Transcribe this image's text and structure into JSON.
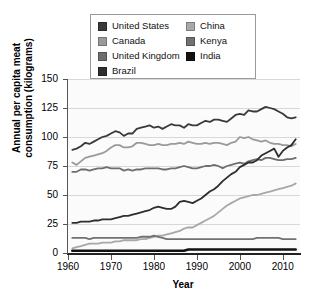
{
  "chart_data": {
    "type": "line",
    "title": "",
    "xlabel": "Year",
    "ylabel": "Annual per capita meat\nconsumption (kilograms)",
    "xlim": [
      1960,
      2014
    ],
    "ylim": [
      0,
      150
    ],
    "yticks": [
      0,
      25,
      50,
      75,
      100,
      125,
      150
    ],
    "xticks": [
      1960,
      1970,
      1980,
      1990,
      2000,
      2010
    ],
    "grid": true,
    "legend_position": "top-center-inside",
    "x": [
      1961,
      1962,
      1963,
      1964,
      1965,
      1966,
      1967,
      1968,
      1969,
      1970,
      1971,
      1972,
      1973,
      1974,
      1975,
      1976,
      1977,
      1978,
      1979,
      1980,
      1981,
      1982,
      1983,
      1984,
      1985,
      1986,
      1987,
      1988,
      1989,
      1990,
      1991,
      1992,
      1993,
      1994,
      1995,
      1996,
      1997,
      1998,
      1999,
      2000,
      2001,
      2002,
      2003,
      2004,
      2005,
      2006,
      2007,
      2008,
      2009,
      2010,
      2011,
      2012,
      2013
    ],
    "series": [
      {
        "name": "United States",
        "color": "#3a3a3a",
        "width": 1.8,
        "values": [
          89,
          90,
          92,
          95,
          94,
          96,
          98,
          100,
          101,
          103,
          105,
          104,
          101,
          103,
          103,
          107,
          108,
          109,
          110,
          108,
          109,
          107,
          109,
          111,
          110,
          110,
          108,
          111,
          110,
          110,
          112,
          114,
          113,
          115,
          115,
          114,
          113,
          116,
          119,
          120,
          119,
          123,
          122,
          122,
          124,
          126,
          125,
          124,
          122,
          120,
          117,
          116,
          117
        ]
      },
      {
        "name": "Canada",
        "color": "#9a9a9a",
        "width": 1.8,
        "values": [
          78,
          76,
          79,
          82,
          83,
          84,
          85,
          86,
          88,
          91,
          93,
          93,
          91,
          91,
          92,
          95,
          95,
          94,
          93,
          93,
          94,
          93,
          93,
          94,
          94,
          95,
          94,
          96,
          95,
          94,
          94,
          95,
          94,
          95,
          95,
          94,
          93,
          95,
          96,
          100,
          99,
          100,
          98,
          97,
          96,
          97,
          95,
          94,
          94,
          93,
          93,
          92,
          94
        ]
      },
      {
        "name": "United Kingdom",
        "color": "#6e6e6e",
        "width": 1.8,
        "values": [
          70,
          70,
          72,
          72,
          71,
          72,
          73,
          73,
          74,
          73,
          73,
          73,
          71,
          72,
          71,
          72,
          72,
          73,
          73,
          73,
          73,
          72,
          72,
          73,
          73,
          74,
          75,
          74,
          73,
          73,
          74,
          75,
          75,
          76,
          75,
          73,
          75,
          76,
          77,
          78,
          77,
          79,
          80,
          81,
          80,
          82,
          82,
          81,
          80,
          80,
          81,
          81,
          82
        ]
      },
      {
        "name": "Brazil",
        "color": "#2e2e2e",
        "width": 1.8,
        "values": [
          26,
          26,
          27,
          27,
          27,
          28,
          28,
          29,
          29,
          29,
          30,
          31,
          32,
          32,
          33,
          34,
          35,
          36,
          37,
          39,
          40,
          39,
          38,
          38,
          40,
          44,
          45,
          44,
          43,
          45,
          47,
          50,
          53,
          55,
          58,
          62,
          65,
          68,
          70,
          74,
          76,
          78,
          78,
          80,
          84,
          86,
          88,
          90,
          83,
          88,
          91,
          93,
          98
        ]
      },
      {
        "name": "China",
        "color": "#a8a8a8",
        "width": 1.8,
        "values": [
          4,
          5,
          6,
          7,
          8,
          8,
          8,
          9,
          9,
          9,
          10,
          10,
          11,
          11,
          11,
          11,
          12,
          12,
          13,
          14,
          15,
          15,
          16,
          17,
          18,
          19,
          21,
          22,
          22,
          24,
          26,
          28,
          30,
          32,
          35,
          38,
          41,
          43,
          45,
          47,
          48,
          49,
          50,
          50,
          51,
          52,
          53,
          54,
          55,
          56,
          57,
          58,
          60
        ]
      },
      {
        "name": "Kenya",
        "color": "#717171",
        "width": 1.8,
        "values": [
          13,
          13,
          13,
          13,
          12,
          13,
          13,
          13,
          13,
          13,
          13,
          13,
          13,
          13,
          13,
          13,
          14,
          14,
          14,
          15,
          14,
          13,
          12,
          12,
          12,
          12,
          12,
          12,
          12,
          12,
          12,
          12,
          12,
          12,
          12,
          12,
          12,
          12,
          12,
          12,
          12,
          12,
          12,
          13,
          13,
          13,
          13,
          13,
          13,
          12,
          12,
          12,
          12
        ]
      },
      {
        "name": "India",
        "color": "#111111",
        "width": 2.6,
        "values": [
          2,
          2,
          2,
          2,
          2,
          2,
          2,
          2,
          2,
          2,
          2,
          2,
          2,
          2,
          2,
          2,
          2,
          2,
          2,
          2,
          2,
          2,
          2,
          2,
          2,
          2,
          2,
          3,
          3,
          3,
          3,
          3,
          3,
          3,
          3,
          3,
          3,
          3,
          3,
          3,
          3,
          3,
          3,
          3,
          3,
          3,
          3,
          3,
          3,
          3,
          3,
          3,
          3
        ]
      }
    ]
  },
  "legend": {
    "left_column": [
      {
        "label": "United States",
        "color": "#3a3a3a"
      },
      {
        "label": "Canada",
        "color": "#9a9a9a"
      },
      {
        "label": "United Kingdom",
        "color": "#6e6e6e"
      },
      {
        "label": "Brazil",
        "color": "#2e2e2e"
      }
    ],
    "right_column": [
      {
        "label": "China",
        "color": "#a8a8a8"
      },
      {
        "label": "Kenya",
        "color": "#717171"
      },
      {
        "label": "India",
        "color": "#111111"
      }
    ]
  }
}
